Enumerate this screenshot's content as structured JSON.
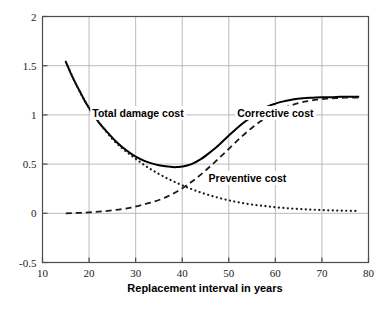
{
  "chart_data": {
    "type": "line",
    "title": "",
    "subtitle": "",
    "xlabel": "Replacement interval in years",
    "ylabel": "",
    "xlim": [
      10,
      80
    ],
    "ylim": [
      -0.5,
      2
    ],
    "xticks": [
      10,
      20,
      30,
      40,
      50,
      60,
      70,
      80
    ],
    "yticks": [
      -0.5,
      0,
      0.5,
      1,
      1.5,
      2
    ],
    "xticklabels": [
      "10",
      "20",
      "30",
      "40",
      "50",
      "60",
      "70",
      "80"
    ],
    "yticklabels": [
      "-0.5",
      "0",
      "0.5",
      "1",
      "1.5",
      "2"
    ],
    "grid": true,
    "grid_x_values": [
      20,
      30,
      40,
      50,
      60,
      70
    ],
    "grid_y_values": [
      0,
      0.5,
      1,
      1.5
    ],
    "grid_color": "#b3b3b3",
    "frame_color": "#4d4d4d",
    "legend_position": "inline-annotations",
    "annotations": [
      {
        "id": "total-damage-cost",
        "text": "Total damage cost",
        "x": 30.5,
        "y": 1.02
      },
      {
        "id": "corrective-cost",
        "text": "Corrective cost",
        "x": 60.0,
        "y": 1.02
      },
      {
        "id": "preventive-cost",
        "text": "Preventive cost",
        "x": 54.0,
        "y": 0.36
      }
    ],
    "series": [
      {
        "name": "Total damage cost",
        "style": "solid",
        "color": "#000000",
        "width": 2.0,
        "x": [
          15,
          16,
          17,
          18,
          19,
          20,
          22,
          24,
          26,
          28,
          30,
          32,
          34,
          36,
          38,
          39,
          40,
          42,
          44,
          46,
          48,
          50,
          52,
          54,
          56,
          58,
          60,
          62,
          64,
          66,
          68,
          70,
          72,
          74,
          76,
          78
        ],
        "values": [
          1.54,
          1.43,
          1.33,
          1.24,
          1.15,
          1.07,
          0.93,
          0.82,
          0.72,
          0.64,
          0.575,
          0.53,
          0.5,
          0.48,
          0.47,
          0.47,
          0.475,
          0.5,
          0.55,
          0.62,
          0.7,
          0.79,
          0.875,
          0.95,
          1.02,
          1.08,
          1.115,
          1.14,
          1.16,
          1.17,
          1.175,
          1.18,
          1.18,
          1.185,
          1.185,
          1.185
        ]
      },
      {
        "name": "Corrective cost",
        "style": "dashed",
        "color": "#1a1a1a",
        "width": 1.8,
        "x": [
          15,
          17,
          19,
          21,
          23,
          25,
          27,
          29,
          31,
          33,
          35,
          37,
          39,
          41,
          43,
          45,
          47,
          49,
          51,
          53,
          55,
          57,
          59,
          61,
          63,
          65,
          67,
          69,
          71,
          73,
          75,
          77,
          78
        ],
        "values": [
          0.0,
          0.003,
          0.007,
          0.012,
          0.02,
          0.03,
          0.042,
          0.058,
          0.08,
          0.105,
          0.135,
          0.175,
          0.225,
          0.285,
          0.355,
          0.435,
          0.52,
          0.61,
          0.7,
          0.79,
          0.87,
          0.94,
          1.0,
          1.05,
          1.09,
          1.12,
          1.14,
          1.155,
          1.165,
          1.17,
          1.175,
          1.175,
          1.175
        ]
      },
      {
        "name": "Preventive cost",
        "style": "dotted",
        "color": "#1a1a1a",
        "width": 2.2,
        "x": [
          15,
          17,
          19,
          21,
          23,
          25,
          27,
          29,
          31,
          33,
          35,
          37,
          39,
          41,
          43,
          45,
          47,
          49,
          51,
          53,
          55,
          57,
          59,
          61,
          63,
          65,
          67,
          69,
          71,
          73,
          75,
          77,
          78
        ],
        "values": [
          1.54,
          1.33,
          1.15,
          1.0,
          0.87,
          0.755,
          0.665,
          0.59,
          0.52,
          0.455,
          0.4,
          0.35,
          0.305,
          0.265,
          0.228,
          0.196,
          0.168,
          0.143,
          0.122,
          0.104,
          0.089,
          0.077,
          0.066,
          0.057,
          0.05,
          0.044,
          0.039,
          0.035,
          0.031,
          0.028,
          0.026,
          0.024,
          0.023
        ]
      }
    ]
  }
}
